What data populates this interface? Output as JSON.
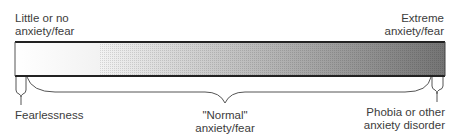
{
  "diagram": {
    "top_labels": {
      "left": [
        "Little or no",
        "anxiety/fear"
      ],
      "right": [
        "Extreme",
        "anxiety/fear"
      ]
    },
    "bottom_labels": {
      "left": "Fearlessness",
      "center": [
        "\"Normal\"",
        "anxiety/fear"
      ],
      "right": [
        "Phobia or other",
        "anxiety disorder"
      ]
    },
    "gradient": {
      "start_color": "#ffffff",
      "end_color": "#6e6e6e"
    },
    "segments": [
      {
        "name": "Fearlessness",
        "from": 0.0,
        "to": 0.04
      },
      {
        "name": "Normal anxiety/fear",
        "from": 0.04,
        "to": 0.955
      },
      {
        "name": "Phobia or other anxiety disorder",
        "from": 0.955,
        "to": 1.0
      }
    ]
  }
}
